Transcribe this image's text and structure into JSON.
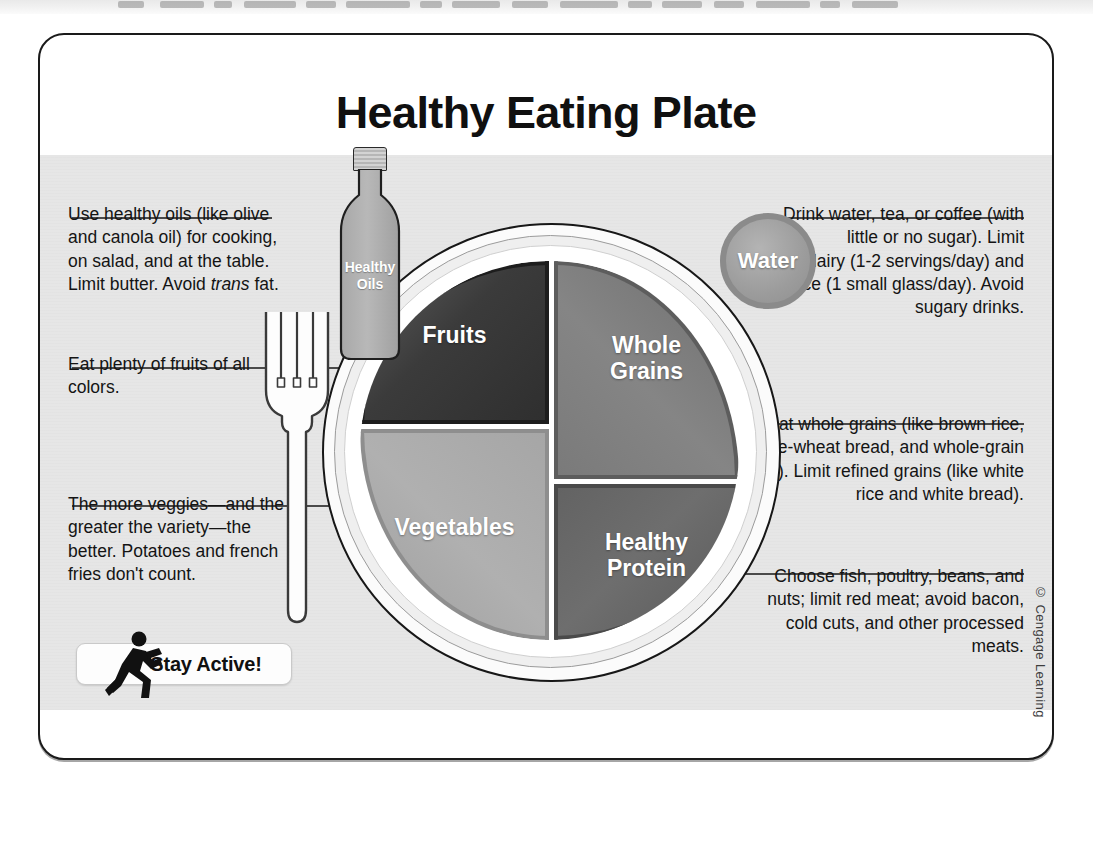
{
  "figure": {
    "title": "Healthy Eating Plate",
    "copyright": "© Cengage Learning"
  },
  "plate": {
    "segments": [
      {
        "key": "fruits",
        "label": "Fruits",
        "color": "#3b3b3b",
        "share_note": "quarter (top-left)"
      },
      {
        "key": "grains",
        "label": "Whole\nGrains",
        "color": "#7a7a7a",
        "share_note": "quarter (top-right)"
      },
      {
        "key": "vegetables",
        "label": "Vegetables",
        "color": "#a6a6a6",
        "share_note": "quarter (bottom-left)"
      },
      {
        "key": "protein",
        "label": "Healthy\nProtein",
        "color": "#636363",
        "share_note": "quarter (bottom-right)"
      }
    ],
    "fruits_label": "Fruits",
    "grains_label_line1": "Whole",
    "grains_label_line2": "Grains",
    "vegetables_label": "Vegetables",
    "protein_label_line1": "Healthy",
    "protein_label_line2": "Protein"
  },
  "oils": {
    "label_line1": "Healthy",
    "label_line2": "Oils"
  },
  "water": {
    "label": "Water"
  },
  "callouts": {
    "oils": "Use healthy oils (like olive and canola oil) for cooking, on salad, and at the table. Limit butter. Avoid trans fat.",
    "oils_pre": "Use healthy oils (like olive and canola oil) for cooking, on salad, and at the table. Limit butter. Avoid ",
    "oils_em": "trans",
    "oils_post": " fat.",
    "fruits": "Eat plenty of fruits of all colors.",
    "vegetables": "The more veggies—and the greater the variety—the better. Potatoes and french fries don't count.",
    "water": "Drink water, tea, or coffee (with little or no sugar). Limit milk/dairy (1-2 servings/day) and juice (1 small glass/day). Avoid sugary drinks.",
    "grains": "Eat whole grains (like brown rice, whole-wheat bread, and whole-grain pasta). Limit refined grains (like white rice and white bread).",
    "protein": "Choose fish, poultry, beans, and nuts; limit red meat; avoid bacon, cold cuts, and other processed meats."
  },
  "stay_active": {
    "label": "Stay Active!"
  }
}
